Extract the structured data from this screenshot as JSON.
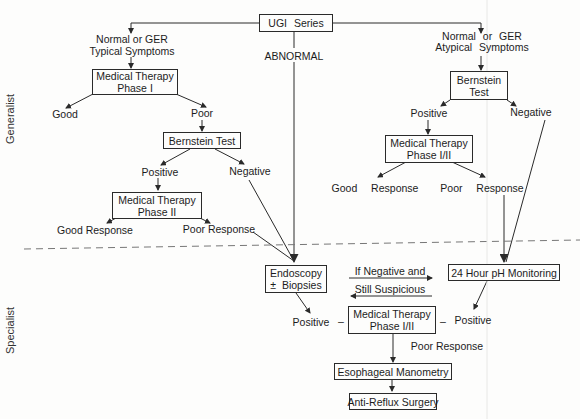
{
  "sections": {
    "generalist": "Generalist",
    "specialist": "Specialist"
  },
  "nodes": {
    "ugi_series": "UGI Series",
    "abnormal": "ABNORMAL",
    "typical_symptoms_1": "Normal or GER",
    "typical_symptoms_2": "Typical Symptoms",
    "atypical_symptoms_1": "Normal or GER",
    "atypical_symptoms_2": "Atypical Symptoms",
    "med_therapy_phase1_1": "Medical Therapy",
    "med_therapy_phase1_2": "Phase I",
    "good_left": "Good",
    "poor_left": "Poor",
    "bernstein_test_left": "Bernstein Test",
    "positive_left": "Positive",
    "negative_left": "Negative",
    "med_therapy_phase2_1": "Medical Therapy",
    "med_therapy_phase2_2": "Phase II",
    "good_response_left": "Good Response",
    "poor_response_left": "Poor Response",
    "bernstein_test_right_1": "Bernstein",
    "bernstein_test_right_2": "Test",
    "positive_right": "Positive",
    "negative_right": "Negative",
    "med_therapy_phase12_right_1": "Medical Therapy",
    "med_therapy_phase12_right_2": "Phase I/II",
    "good_response_right": "Good  Response",
    "poor_response_right": "Poor  Response",
    "endoscopy_1": "Endoscopy",
    "endoscopy_2": "±  Biopsies",
    "if_negative": "If Negative and",
    "still_suspicious": "Still Suspicious",
    "ph_monitoring": "24 Hour pH Monitoring",
    "positive_endo": "Positive",
    "positive_ph": "Positive",
    "dash_left": "–",
    "dash_right": "–",
    "med_therapy_phase12_bottom_1": "Medical Therapy",
    "med_therapy_phase12_bottom_2": "Phase I/II",
    "poor_response_bottom": "Poor Response",
    "esophageal_manometry": "Esophageal Manometry",
    "anti_reflux_surgery": "Anti-Reflux Surgery"
  },
  "colors": {
    "line": "#2a2a2a",
    "divider": "#777777",
    "background": "#fdfdfc"
  }
}
